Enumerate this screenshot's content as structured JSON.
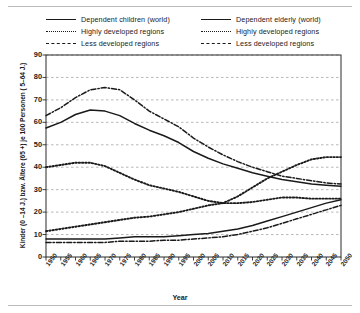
{
  "chart_data": {
    "type": "line",
    "title": "",
    "xlabel": "Year",
    "ylabel": "Kinder (0 –14 J.) bzw. Ältere (65 +) je 100 Personen ( 5–64 J.)",
    "xlim": [
      1950,
      2050
    ],
    "ylim": [
      0,
      90
    ],
    "yticks": [
      0,
      10,
      20,
      30,
      40,
      50,
      60,
      70,
      80,
      90
    ],
    "grid": true,
    "legend_position": "top",
    "x": [
      1950,
      1955,
      1960,
      1965,
      1970,
      1975,
      1980,
      1985,
      1990,
      1995,
      2000,
      2005,
      2010,
      2015,
      2020,
      2025,
      2030,
      2035,
      2040,
      2045,
      2050
    ],
    "xticklabels": [
      "1950",
      "1955",
      "1960",
      "1965",
      "1970",
      "1975",
      "1980",
      "1985",
      "1990",
      "1995",
      "2000",
      "2005",
      "2010",
      "2015",
      "2020",
      "2025",
      "2030",
      "2035",
      "2040",
      "2045",
      "2050"
    ],
    "series": [
      {
        "name": "Dependent children (world)",
        "style": "solid",
        "values": [
          57.5,
          60.0,
          63.5,
          65.5,
          65.0,
          63.0,
          59.5,
          56.5,
          54.0,
          51.0,
          47.0,
          44.0,
          41.5,
          39.5,
          37.5,
          36.0,
          34.5,
          33.5,
          32.5,
          32.0,
          31.5
        ]
      },
      {
        "name": "Dependent children – Highly developed regions",
        "style": "dotted",
        "values": [
          40.0,
          41.0,
          42.0,
          42.0,
          40.5,
          37.5,
          34.5,
          32.0,
          30.5,
          29.0,
          27.0,
          25.0,
          24.0,
          24.0,
          24.5,
          25.5,
          26.5,
          26.5,
          26.0,
          26.0,
          26.0
        ]
      },
      {
        "name": "Dependent children – Less developed regions",
        "style": "dashdot",
        "values": [
          63.0,
          66.5,
          71.0,
          74.5,
          75.5,
          74.5,
          70.0,
          65.0,
          61.5,
          58.0,
          53.0,
          49.0,
          45.5,
          42.5,
          40.0,
          38.0,
          36.0,
          35.0,
          34.0,
          33.0,
          32.5
        ]
      },
      {
        "name": "Dependent elderly (world)",
        "style": "solid",
        "values": [
          8.0,
          8.0,
          8.0,
          8.0,
          8.0,
          8.5,
          9.0,
          9.0,
          9.0,
          9.5,
          10.0,
          10.5,
          11.5,
          12.5,
          14.0,
          16.0,
          18.0,
          20.0,
          22.0,
          24.0,
          25.5
        ]
      },
      {
        "name": "Dependent elderly – Highly developed regions",
        "style": "dotted",
        "values": [
          11.5,
          12.5,
          13.5,
          14.5,
          15.5,
          16.5,
          17.5,
          18.0,
          19.0,
          20.0,
          21.5,
          23.0,
          24.0,
          27.0,
          31.0,
          35.0,
          38.0,
          41.0,
          43.5,
          44.5,
          44.5
        ]
      },
      {
        "name": "Dependent elderly – Less developed regions",
        "style": "dashdot",
        "values": [
          6.5,
          6.5,
          6.5,
          6.5,
          6.5,
          7.0,
          7.0,
          7.0,
          7.5,
          7.5,
          8.0,
          8.5,
          9.0,
          10.0,
          11.5,
          13.0,
          15.0,
          17.0,
          19.0,
          21.0,
          23.0
        ]
      }
    ]
  },
  "legend": {
    "left": [
      {
        "label": "Dependent children (world)",
        "style": "solid"
      },
      {
        "label": "Highly developed regions",
        "style": "dotted"
      },
      {
        "label": "Less developed regions",
        "style": "dashdot"
      }
    ],
    "right": [
      {
        "label": "Dependent elderly (world)",
        "style": "solid"
      },
      {
        "label": "Highly developed regions",
        "style": "dotted"
      },
      {
        "label": "Less developed regions",
        "style": "dashdot"
      }
    ]
  },
  "colors": {
    "line": "#1a1a1a",
    "grid": "#9a9a9a",
    "frame": "#2b2b2b",
    "rule": "#b9b9b9",
    "background": "#ffffff"
  }
}
